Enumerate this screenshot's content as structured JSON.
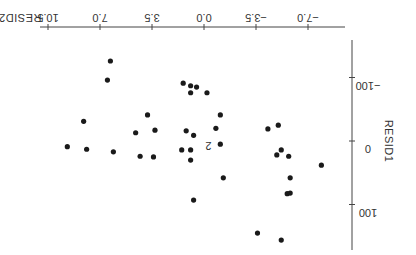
{
  "chart_data": {
    "type": "scatter",
    "title": "",
    "orientation_note": "figure rendered rotated 180 degrees",
    "xlabel": "RESID2",
    "ylabel": "RESID1",
    "x_ticks": [
      "-7.0",
      "-3.5",
      "0.0",
      "3.5",
      "7.0",
      "10.5"
    ],
    "y_ticks": [
      "-100",
      "0",
      "100"
    ],
    "xlim": [
      -7.5,
      11.5
    ],
    "ylim": [
      -170,
      170
    ],
    "grid": false,
    "points": [
      {
        "x": 6.3,
        "y": -126
      },
      {
        "x": 6.5,
        "y": -96
      },
      {
        "x": 1.4,
        "y": -91
      },
      {
        "x": 0.9,
        "y": -87
      },
      {
        "x": 0.5,
        "y": -85
      },
      {
        "x": 0.9,
        "y": -76
      },
      {
        "x": -0.2,
        "y": -76
      },
      {
        "x": 3.8,
        "y": -41
      },
      {
        "x": -1.1,
        "y": -41
      },
      {
        "x": 8.1,
        "y": -31
      },
      {
        "x": -0.8,
        "y": -20
      },
      {
        "x": 1.2,
        "y": -16
      },
      {
        "x": 0.7,
        "y": -9
      },
      {
        "x": -4.3,
        "y": -19
      },
      {
        "x": -5.0,
        "y": -25
      },
      {
        "x": 4.6,
        "y": -13
      },
      {
        "x": 3.3,
        "y": -17
      },
      {
        "x": 9.2,
        "y": 9
      },
      {
        "x": 7.9,
        "y": 13
      },
      {
        "x": -1.1,
        "y": 5
      },
      {
        "x": 1.5,
        "y": 14
      },
      {
        "x": 0.9,
        "y": 14
      },
      {
        "x": -5.2,
        "y": 14
      },
      {
        "x": -5.7,
        "y": 24
      },
      {
        "x": -4.9,
        "y": 22
      },
      {
        "x": 4.3,
        "y": 24
      },
      {
        "x": 0.9,
        "y": 30
      },
      {
        "x": 6.1,
        "y": 17
      },
      {
        "x": 3.4,
        "y": 25
      },
      {
        "x": -1.3,
        "y": 58
      },
      {
        "x": -5.8,
        "y": 58
      },
      {
        "x": -7.9,
        "y": 38
      },
      {
        "x": -5.6,
        "y": 83
      },
      {
        "x": -5.8,
        "y": 82
      },
      {
        "x": 0.7,
        "y": 93
      },
      {
        "x": -3.6,
        "y": 145
      },
      {
        "x": -5.2,
        "y": 156
      }
    ],
    "annotations": [
      {
        "text": "2",
        "x": -0.3,
        "y": 2
      }
    ]
  }
}
